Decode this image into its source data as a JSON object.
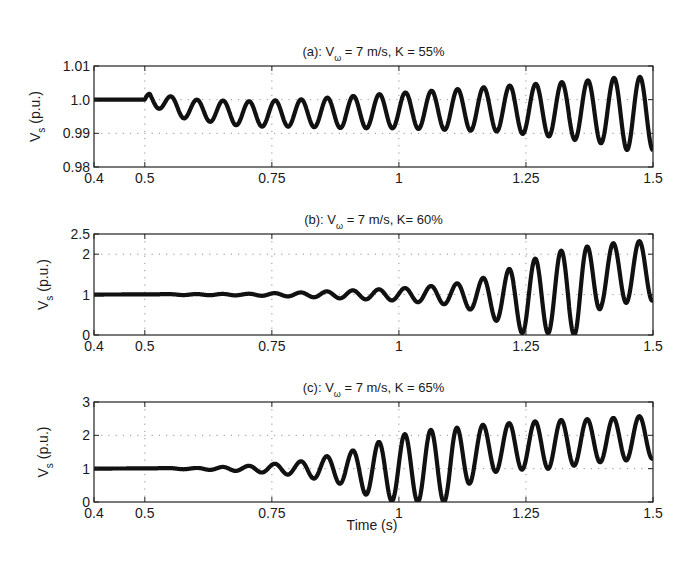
{
  "figure": {
    "xlabel": "Time (s)",
    "ylabel_main": "V",
    "ylabel_sub": "s",
    "ylabel_unit": " (p.u.)"
  },
  "panels": [
    {
      "id": "a",
      "title_prefix": "(a): V",
      "title_sub": "ω",
      "title_suffix": " = 7 m/s, K = 55%",
      "ylim": [
        0.98,
        1.01
      ],
      "yticks": [
        0.98,
        0.99,
        1.0,
        1.01
      ],
      "yticklabels": [
        "0.98",
        "0.99",
        "1.0",
        "1.01"
      ],
      "ygrid": [
        0.99,
        1.0
      ]
    },
    {
      "id": "b",
      "title_prefix": "(b): V",
      "title_sub": "ω",
      "title_suffix": " = 7 m/s, K= 60%",
      "ylim": [
        0,
        2.5
      ],
      "yticks": [
        0,
        1,
        2,
        2.5
      ],
      "yticklabels": [
        "0",
        "1",
        "2",
        "2.5"
      ],
      "ygrid": [
        1,
        2
      ]
    },
    {
      "id": "c",
      "title_prefix": "(c): V",
      "title_sub": "ω",
      "title_suffix": " = 7 m/s, K = 65%",
      "ylim": [
        0,
        3
      ],
      "yticks": [
        0,
        1,
        2,
        3
      ],
      "yticklabels": [
        "0",
        "1",
        "2",
        "3"
      ],
      "ygrid": [
        1,
        2
      ]
    }
  ],
  "xaxis": {
    "xlim": [
      0.4,
      1.5
    ],
    "xticks": [
      0.4,
      0.5,
      0.75,
      1,
      1.25,
      1.5
    ],
    "xticklabels": [
      "0.4",
      "0.5",
      "0.75",
      "1",
      "1.25",
      "1.5"
    ],
    "xgrid": [
      0.5,
      0.75,
      1,
      1.25
    ]
  },
  "chart_data": [
    {
      "type": "line",
      "title": "(a): Vω = 7 m/s, K = 55%",
      "xlabel": "",
      "ylabel": "Vs (p.u.)",
      "xlim": [
        0.4,
        1.5
      ],
      "ylim": [
        0.98,
        1.01
      ],
      "grid": true,
      "series": [
        {
          "name": "Vs",
          "description": "Flat at 1.0 until t=0.5 s, then oscillation (~20 Hz) with slowly growing amplitude; mean ~0.996",
          "x": [
            0.4,
            0.5,
            0.51,
            0.55,
            0.6,
            0.7,
            0.8,
            0.9,
            1.0,
            1.1,
            1.2,
            1.3,
            1.4,
            1.45,
            1.5
          ],
          "upper_envelope": [
            1.0,
            1.0,
            1.003,
            1.001,
            1.0,
            0.9995,
            1.0,
            1.001,
            1.002,
            1.003,
            1.004,
            1.005,
            1.006,
            1.007,
            1.0065
          ],
          "lower_envelope": [
            1.0,
            1.0,
            0.999,
            0.995,
            0.994,
            0.992,
            0.992,
            0.9915,
            0.9915,
            0.991,
            0.9905,
            0.989,
            0.987,
            0.985,
            0.985
          ]
        }
      ]
    },
    {
      "type": "line",
      "title": "(b): Vω = 7 m/s, K= 60%",
      "xlabel": "",
      "ylabel": "Vs (p.u.)",
      "xlim": [
        0.4,
        1.5
      ],
      "ylim": [
        0,
        2.5
      ],
      "grid": true,
      "series": [
        {
          "name": "Vs",
          "description": "Steady at 1.0 p.u., slowly growing oscillation after ~0.7 s, becoming unstable after ~1.15 s",
          "x": [
            0.4,
            0.7,
            0.8,
            0.9,
            1.0,
            1.1,
            1.15,
            1.2,
            1.25,
            1.3,
            1.35,
            1.4,
            1.45,
            1.5
          ],
          "upper_envelope": [
            1.0,
            1.02,
            1.05,
            1.1,
            1.15,
            1.25,
            1.35,
            1.55,
            1.8,
            2.05,
            2.15,
            2.25,
            2.3,
            2.35
          ],
          "lower_envelope": [
            1.0,
            0.98,
            0.95,
            0.9,
            0.85,
            0.75,
            0.6,
            0.3,
            0.0,
            0.05,
            0.0,
            0.7,
            0.8,
            0.85
          ]
        }
      ]
    },
    {
      "type": "line",
      "title": "(c): Vω = 7 m/s, K = 65%",
      "xlabel": "Time (s)",
      "ylabel": "Vs (p.u.)",
      "xlim": [
        0.4,
        1.5
      ],
      "ylim": [
        0,
        3
      ],
      "grid": true,
      "series": [
        {
          "name": "Vs",
          "description": "Steady at 1.0 p.u., oscillation grows from ~0.6 s, dips to 0 around 0.95–1.12 s, then sustained oscillation ~1.5–2.6 p.u.",
          "x": [
            0.4,
            0.6,
            0.7,
            0.8,
            0.9,
            0.95,
            1.0,
            1.05,
            1.1,
            1.15,
            1.2,
            1.3,
            1.4,
            1.5
          ],
          "upper_envelope": [
            1.0,
            1.02,
            1.08,
            1.2,
            1.5,
            1.75,
            2.0,
            2.15,
            2.2,
            2.3,
            2.35,
            2.45,
            2.5,
            2.6
          ],
          "lower_envelope": [
            1.0,
            0.98,
            0.92,
            0.8,
            0.5,
            0.1,
            0.0,
            0.0,
            0.0,
            0.7,
            0.95,
            1.0,
            1.2,
            1.3
          ]
        }
      ]
    }
  ]
}
